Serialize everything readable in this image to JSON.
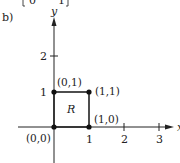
{
  "figure": {
    "part_label": "b)",
    "top_fragment": "[0    1]",
    "axes": {
      "x_label": "x",
      "y_label": "y",
      "x_ticks": [
        "1",
        "2",
        "3"
      ],
      "y_ticks": [
        "1",
        "2"
      ]
    },
    "region": {
      "label": "R",
      "vertices": [
        {
          "label": "(0,0)",
          "x": 0,
          "y": 0
        },
        {
          "label": "(1,0)",
          "x": 1,
          "y": 0
        },
        {
          "label": "(1,1)",
          "x": 1,
          "y": 1
        },
        {
          "label": "(0,1)",
          "x": 0,
          "y": 1
        }
      ]
    },
    "colors": {
      "ink": "#222222",
      "background": "#ffffff"
    }
  }
}
